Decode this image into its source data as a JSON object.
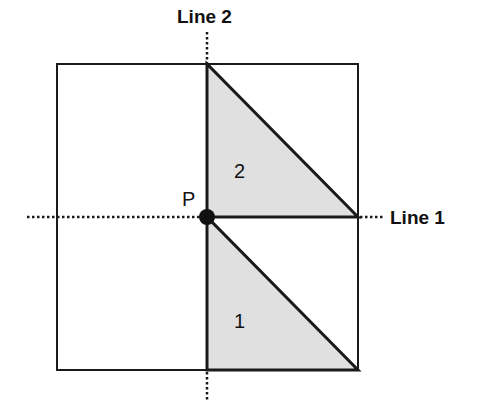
{
  "diagram": {
    "labels": {
      "line1": "Line 1",
      "line2": "Line 2",
      "point": "P",
      "region1": "1",
      "region2": "2"
    },
    "colors": {
      "stroke": "#1a1a1a",
      "fill": "#e0e0e0",
      "background": "#ffffff"
    },
    "square": {
      "x": 57,
      "y": 64,
      "width": 301,
      "height": 306
    },
    "point_p": {
      "x": 207,
      "y": 217
    },
    "line1": {
      "y": 217,
      "x_start": 27,
      "x_end": 385,
      "style": "dotted"
    },
    "line2": {
      "x": 207,
      "y_start": 32,
      "y_end": 400,
      "style": "dotted"
    },
    "triangles": [
      {
        "id": "2",
        "points": [
          [
            207,
            64
          ],
          [
            207,
            217
          ],
          [
            358,
            217
          ]
        ]
      },
      {
        "id": "1",
        "points": [
          [
            207,
            217
          ],
          [
            207,
            370
          ],
          [
            358,
            370
          ]
        ]
      }
    ]
  }
}
